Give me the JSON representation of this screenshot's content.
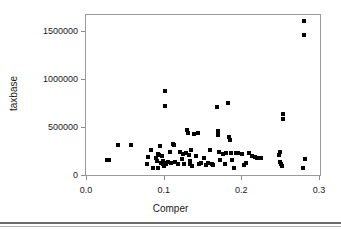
{
  "chart_data": {
    "type": "scatter",
    "title": "",
    "xlabel": "Comper",
    "ylabel": "taxbase",
    "xlim": [
      -0.008,
      0.304
    ],
    "ylim": [
      -40000,
      1690000
    ],
    "xticks": [
      0.0,
      0.1,
      0.2,
      0.3
    ],
    "xticklabels": [
      "0.0",
      "0.1",
      "0.2",
      "0.3"
    ],
    "yticks": [
      0,
      500000,
      1000000,
      1500000
    ],
    "yticklabels": [
      "0",
      "500000",
      "1000000",
      "1500000"
    ],
    "grid": false,
    "legend": false,
    "marker": "filled-square",
    "marker_color": "#000000",
    "marker_size_px": 4,
    "n_points": 86,
    "points": [
      [
        0.0275,
        158000
      ],
      [
        0.03,
        156000
      ],
      [
        0.0415,
        310000
      ],
      [
        0.0585,
        310000
      ],
      [
        0.0785,
        110000
      ],
      [
        0.0795,
        188000
      ],
      [
        0.084,
        262000
      ],
      [
        0.086,
        78000
      ],
      [
        0.0905,
        182000
      ],
      [
        0.091,
        148000
      ],
      [
        0.0925,
        222000
      ],
      [
        0.093,
        76000
      ],
      [
        0.0945,
        210000
      ],
      [
        0.095,
        300000
      ],
      [
        0.096,
        120000
      ],
      [
        0.0975,
        196000
      ],
      [
        0.0985,
        142000
      ],
      [
        0.0995,
        115000
      ],
      [
        0.1,
        96000
      ],
      [
        0.101,
        130000
      ],
      [
        0.1015,
        870000
      ],
      [
        0.102,
        720000
      ],
      [
        0.1035,
        118000
      ],
      [
        0.105,
        132000
      ],
      [
        0.108,
        238000
      ],
      [
        0.1095,
        126000
      ],
      [
        0.1115,
        322000
      ],
      [
        0.113,
        316000
      ],
      [
        0.1145,
        132000
      ],
      [
        0.119,
        110000
      ],
      [
        0.1215,
        240000
      ],
      [
        0.123,
        170000
      ],
      [
        0.125,
        216000
      ],
      [
        0.1265,
        118000
      ],
      [
        0.1285,
        232000
      ],
      [
        0.13,
        470000
      ],
      [
        0.131,
        440000
      ],
      [
        0.1325,
        206000
      ],
      [
        0.1335,
        150000
      ],
      [
        0.1345,
        112000
      ],
      [
        0.1355,
        258000
      ],
      [
        0.136,
        96000
      ],
      [
        0.1395,
        430000
      ],
      [
        0.142,
        196000
      ],
      [
        0.144,
        440000
      ],
      [
        0.1455,
        114000
      ],
      [
        0.148,
        120000
      ],
      [
        0.152,
        180000
      ],
      [
        0.1545,
        108000
      ],
      [
        0.1575,
        128000
      ],
      [
        0.16,
        262000
      ],
      [
        0.162,
        118000
      ],
      [
        0.164,
        104000
      ],
      [
        0.169,
        712000
      ],
      [
        0.17,
        460000
      ],
      [
        0.1705,
        418000
      ],
      [
        0.1715,
        236000
      ],
      [
        0.1725,
        152000
      ],
      [
        0.176,
        224000
      ],
      [
        0.179,
        116000
      ],
      [
        0.1805,
        230000
      ],
      [
        0.183,
        745000
      ],
      [
        0.184,
        400000
      ],
      [
        0.185,
        364000
      ],
      [
        0.187,
        232000
      ],
      [
        0.188,
        152000
      ],
      [
        0.19,
        78000
      ],
      [
        0.193,
        234000
      ],
      [
        0.1955,
        226000
      ],
      [
        0.201,
        216000
      ],
      [
        0.2035,
        108000
      ],
      [
        0.206,
        120000
      ],
      [
        0.21,
        226000
      ],
      [
        0.214,
        194000
      ],
      [
        0.2175,
        188000
      ],
      [
        0.22,
        178000
      ],
      [
        0.2255,
        172000
      ],
      [
        0.248,
        208000
      ],
      [
        0.2495,
        240000
      ],
      [
        0.25,
        138000
      ],
      [
        0.2505,
        112000
      ],
      [
        0.252,
        92000
      ],
      [
        0.253,
        640000
      ],
      [
        0.2535,
        580000
      ],
      [
        0.279,
        76000
      ],
      [
        0.2815,
        168000
      ],
      [
        0.2805,
        1605000
      ],
      [
        0.281,
        1455000
      ]
    ]
  },
  "axes": {
    "x_title": "Comper",
    "y_title": "taxbase"
  }
}
